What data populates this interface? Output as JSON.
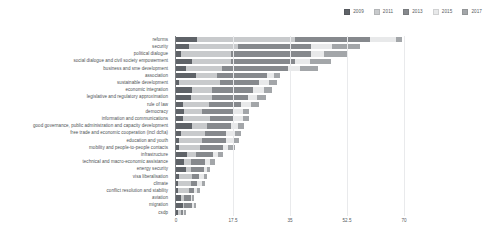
{
  "legend": {
    "position": "top-right",
    "items": [
      {
        "label": "2009",
        "color": "#5f6368"
      },
      {
        "label": "2011",
        "color": "#c8cacc"
      },
      {
        "label": "2013",
        "color": "#86898d"
      },
      {
        "label": "2015",
        "color": "#e8e9ea"
      },
      {
        "label": "2017",
        "color": "#a3a6a9"
      }
    ]
  },
  "axis": {
    "x_ticks": [
      "0",
      "17.5",
      "35",
      "52.5",
      "70"
    ],
    "x_tick_values": [
      0,
      17.5,
      35,
      52.5,
      70
    ]
  },
  "chart_data": {
    "type": "bar",
    "orientation": "horizontal",
    "stacked": true,
    "title": "",
    "subtitle": "",
    "xlabel": "",
    "ylabel": "",
    "xlim": [
      0,
      70
    ],
    "grid": true,
    "legend_position": "top-right",
    "categories": [
      "reforms",
      "security",
      "political dialogue",
      "social dialogue and civil society empowerment",
      "business and sme development",
      "association",
      "sustainable development",
      "economic integration",
      "legislative and regulatory approximation",
      "rule of law",
      "democracy",
      "information and communications",
      "good governance, public administration and capacity development",
      "free trade and economic cooperation (incl dcfta)",
      "education and youth",
      "mobility and people-to-people contacts",
      "infrastructure",
      "technical and macro-economic assistance",
      "energy security",
      "visa liberalisation",
      "climate",
      "conflict resolution and stability",
      "aviation",
      "migration",
      "csdp"
    ],
    "series": [
      {
        "name": "2009",
        "color": "#5f6368",
        "values": [
          6.5,
          4.0,
          1.5,
          5.0,
          3.0,
          6.0,
          1.0,
          5.0,
          4.5,
          2.0,
          2.5,
          2.0,
          5.0,
          1.5,
          1.0,
          1.0,
          3.5,
          2.5,
          3.0,
          1.0,
          0.5,
          0.5,
          1.5,
          2.0,
          0.5
        ]
      },
      {
        "name": "2011",
        "color": "#c8cacc",
        "values": [
          30.0,
          15.0,
          15.5,
          12.0,
          11.0,
          6.5,
          12.5,
          6.0,
          6.5,
          8.0,
          5.5,
          8.5,
          4.5,
          7.5,
          7.0,
          6.5,
          2.5,
          2.0,
          1.5,
          4.0,
          4.0,
          3.5,
          1.0,
          0.5,
          1.0
        ]
      },
      {
        "name": "2013",
        "color": "#86898d",
        "values": [
          23.0,
          22.5,
          24.5,
          19.5,
          20.5,
          15.5,
          12.0,
          12.5,
          11.0,
          10.0,
          9.5,
          7.0,
          7.5,
          6.5,
          7.5,
          7.0,
          5.5,
          4.5,
          4.0,
          2.0,
          2.0,
          1.5,
          2.0,
          2.5,
          0.5
        ]
      },
      {
        "name": "2015",
        "color": "#e8e9ea",
        "values": [
          8.0,
          6.5,
          4.0,
          4.5,
          3.5,
          2.0,
          3.0,
          3.5,
          3.0,
          3.0,
          3.0,
          3.0,
          2.0,
          2.5,
          2.0,
          1.5,
          1.5,
          1.5,
          1.0,
          1.5,
          1.5,
          1.0,
          0.5,
          0.5,
          0.5
        ]
      },
      {
        "name": "2017",
        "color": "#a3a6a9",
        "values": [
          2.0,
          8.5,
          7.0,
          6.5,
          5.5,
          2.0,
          2.5,
          2.5,
          2.5,
          2.5,
          2.0,
          2.0,
          2.0,
          2.0,
          2.0,
          2.0,
          1.5,
          1.5,
          1.0,
          1.0,
          1.0,
          1.0,
          0.5,
          0.5,
          0.5
        ]
      }
    ]
  }
}
